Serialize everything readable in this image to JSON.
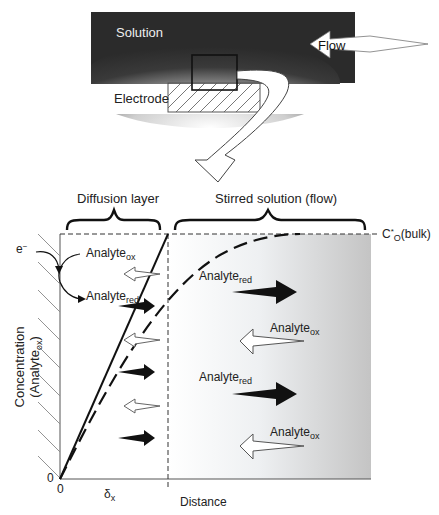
{
  "top_panel": {
    "solution_label": "Solution",
    "flow_label": "Flow",
    "electrode_label": "Electrode"
  },
  "graph": {
    "diffusion_layer_label": "Diffusion layer",
    "stirred_solution_label": "Stirred solution (flow)",
    "bulk_label_main": "C",
    "bulk_label_sup": "*",
    "bulk_label_sub": "O",
    "bulk_label_tail": "(bulk)",
    "electron_label": "e",
    "electron_sup": "−",
    "analyte_ox": {
      "main": "Analyte",
      "sub": "ox"
    },
    "analyte_red": {
      "main": "Analyte",
      "sub": "red"
    },
    "y_axis_label_line1": "Concentration",
    "y_axis_label_line2_main": "(Analyte",
    "y_axis_label_line2_sub": "ox",
    "y_axis_label_line2_tail": ")",
    "y_origin": "0",
    "x_origin": "0",
    "delta_main": "δ",
    "delta_sub": "x",
    "x_axis_label": "Distance"
  },
  "colors": {
    "solution_dark": "#2b2b2b",
    "ink": "#1a1a1a",
    "stirred_shade": "#c9c9c9"
  }
}
